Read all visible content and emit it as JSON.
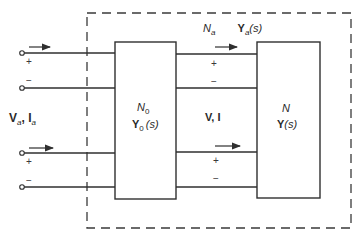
{
  "diagram": {
    "type": "two-port network interconnection",
    "colors": {
      "line": "#2f2f2f",
      "background": "#ffffff"
    },
    "enclosure": {
      "style": "dashed",
      "label_network": "N",
      "label_network_sub": "a",
      "label_admittance": "Y",
      "label_admittance_sub": "a",
      "label_admittance_arg": "(s)"
    },
    "left_port": {
      "voltage": "V",
      "voltage_sub": "a",
      "sep": ", ",
      "current": "I",
      "current_sub": "a"
    },
    "block_left": {
      "name": "N",
      "name_sub": "0",
      "admittance": "Y",
      "admittance_sub": "0",
      "admittance_arg": "(s)"
    },
    "middle_port": {
      "label": "V, I"
    },
    "block_right": {
      "name": "N",
      "admittance": "Y",
      "admittance_arg": "(s)"
    },
    "polarity": {
      "plus": "+",
      "minus": "−"
    }
  }
}
